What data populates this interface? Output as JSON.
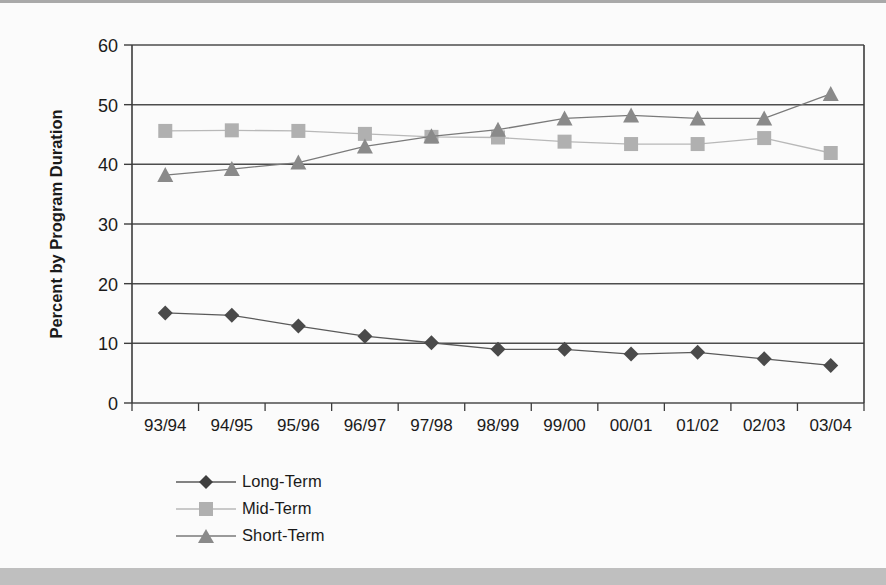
{
  "chart_data": {
    "type": "line",
    "title": "",
    "subtitle": "",
    "xlabel": "",
    "ylabel": "Percent by Program Duration",
    "categories": [
      "93/94",
      "94/95",
      "95/96",
      "96/97",
      "97/98",
      "98/99",
      "99/00",
      "00/01",
      "01/02",
      "02/03",
      "03/04"
    ],
    "ylim": [
      0,
      60
    ],
    "ytick_step": 10,
    "yticks": [
      "0",
      "10",
      "20",
      "30",
      "40",
      "50",
      "60"
    ],
    "grid": "horizontal",
    "legend_position": "bottom-left",
    "series": [
      {
        "name": "Long-Term",
        "marker": "diamond",
        "color": "#4a4a4a",
        "line_color": "#5a5a5a",
        "values": [
          15.1,
          14.7,
          12.9,
          11.2,
          10.1,
          9.0,
          9.0,
          8.2,
          8.5,
          7.4,
          6.3
        ]
      },
      {
        "name": "Mid-Term",
        "marker": "square",
        "color": "#b0b0b0",
        "line_color": "#b8b8b8",
        "values": [
          45.6,
          45.7,
          45.6,
          45.1,
          44.6,
          44.5,
          43.8,
          43.4,
          43.4,
          44.4,
          41.9
        ]
      },
      {
        "name": "Short-Term",
        "marker": "triangle",
        "color": "#8a8a8a",
        "line_color": "#7a7a7a",
        "values": [
          38.2,
          39.2,
          40.3,
          43.0,
          44.7,
          45.8,
          47.7,
          48.2,
          47.7,
          47.7,
          51.8
        ]
      }
    ]
  },
  "legend": {
    "items": [
      {
        "label": "Long-Term",
        "marker": "diamond"
      },
      {
        "label": "Mid-Term",
        "marker": "square"
      },
      {
        "label": "Short-Term",
        "marker": "triangle"
      }
    ]
  },
  "axis": {
    "y_title": "Percent by Program Duration"
  },
  "colors": {
    "page_background": "#fbfbfb",
    "plot_border": "#3d3d3d",
    "gridline": "#4d4d4d",
    "text": "#1a1a1a",
    "bottom_band": "#bfbfbf"
  }
}
